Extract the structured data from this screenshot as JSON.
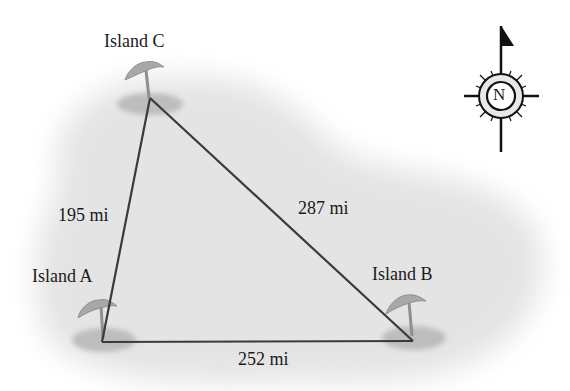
{
  "diagram": {
    "type": "triangle-distance-map",
    "islands": [
      {
        "id": "A",
        "label": "Island A",
        "x": 102,
        "y": 342
      },
      {
        "id": "B",
        "label": "Island B",
        "x": 413,
        "y": 341
      },
      {
        "id": "C",
        "label": "Island C",
        "x": 150,
        "y": 98
      }
    ],
    "edges": [
      {
        "from": "A",
        "to": "C",
        "label": "195 mi"
      },
      {
        "from": "C",
        "to": "B",
        "label": "287 mi"
      },
      {
        "from": "A",
        "to": "B",
        "label": "252 mi"
      }
    ],
    "compass": {
      "letter": "N",
      "icon": "north-compass-rose"
    },
    "colors": {
      "line": "#3a3a3a",
      "sea": "#e6e6e6",
      "island_shadow": "#bdbdbd",
      "palm": "#a8a8a8",
      "text": "#1a1a1a"
    }
  }
}
